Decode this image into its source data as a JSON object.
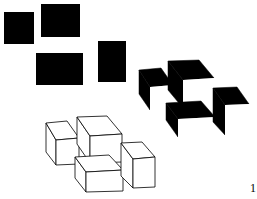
{
  "figure": {
    "background": "#ffffff",
    "ink": "#000000",
    "label": "1",
    "black_rectangles": [
      {
        "x": 4,
        "y": 12,
        "w": 30,
        "h": 32
      },
      {
        "x": 41,
        "y": 4,
        "w": 39,
        "h": 33
      },
      {
        "x": 36,
        "y": 53,
        "w": 47,
        "h": 32
      },
      {
        "x": 98,
        "y": 41,
        "w": 28,
        "h": 41
      }
    ],
    "shaded_cubes": [
      {
        "back": [
          [
            139,
            70
          ],
          [
            161,
            68
          ],
          [
            173,
            85
          ],
          [
            150,
            87
          ]
        ],
        "side": [
          [
            139,
            70
          ],
          [
            150,
            87
          ],
          [
            150,
            110
          ],
          [
            139,
            94
          ]
        ],
        "front": [
          [
            150,
            87
          ],
          [
            173,
            85
          ],
          [
            173,
            110
          ],
          [
            150,
            110
          ]
        ]
      },
      {
        "back": [
          [
            168,
            61
          ],
          [
            199,
            60
          ],
          [
            214,
            78
          ],
          [
            183,
            80
          ]
        ],
        "side": [
          [
            168,
            61
          ],
          [
            183,
            80
          ],
          [
            183,
            108
          ],
          [
            168,
            90
          ]
        ],
        "front": [
          [
            183,
            80
          ],
          [
            214,
            78
          ],
          [
            214,
            105
          ],
          [
            183,
            107
          ]
        ]
      },
      {
        "back": [
          [
            166,
            103
          ],
          [
            201,
            101
          ],
          [
            215,
            117
          ],
          [
            178,
            119
          ]
        ],
        "side": [
          [
            166,
            103
          ],
          [
            178,
            119
          ],
          [
            178,
            137
          ],
          [
            166,
            120
          ]
        ],
        "front": [
          [
            178,
            119
          ],
          [
            215,
            117
          ],
          [
            215,
            137
          ],
          [
            178,
            137
          ]
        ]
      },
      {
        "back": [
          [
            213,
            88
          ],
          [
            237,
            87
          ],
          [
            249,
            104
          ],
          [
            225,
            105
          ]
        ],
        "side": [
          [
            213,
            88
          ],
          [
            225,
            105
          ],
          [
            225,
            135
          ],
          [
            213,
            122
          ]
        ],
        "front": [
          [
            225,
            105
          ],
          [
            249,
            104
          ],
          [
            249,
            134
          ],
          [
            225,
            135
          ]
        ]
      }
    ],
    "wire_cubes": [
      {
        "top": [
          [
            46,
            123
          ],
          [
            67,
            121
          ],
          [
            79,
            138
          ],
          [
            56,
            140
          ]
        ],
        "front": [
          [
            56,
            140
          ],
          [
            79,
            138
          ],
          [
            79,
            164
          ],
          [
            56,
            165
          ]
        ],
        "side": [
          [
            46,
            123
          ],
          [
            56,
            140
          ],
          [
            56,
            165
          ],
          [
            46,
            152
          ]
        ]
      },
      {
        "top": [
          [
            77,
            117
          ],
          [
            107,
            116
          ],
          [
            122,
            134
          ],
          [
            90,
            136
          ]
        ],
        "front": [
          [
            90,
            136
          ],
          [
            122,
            134
          ],
          [
            122,
            162
          ],
          [
            90,
            163
          ]
        ],
        "side": [
          [
            77,
            117
          ],
          [
            90,
            136
          ],
          [
            90,
            163
          ],
          [
            77,
            144
          ]
        ]
      },
      {
        "top": [
          [
            75,
            157
          ],
          [
            109,
            155
          ],
          [
            123,
            170
          ],
          [
            86,
            172
          ]
        ],
        "front": [
          [
            86,
            172
          ],
          [
            123,
            170
          ],
          [
            123,
            191
          ],
          [
            86,
            192
          ]
        ],
        "side": [
          [
            75,
            157
          ],
          [
            86,
            172
          ],
          [
            86,
            192
          ],
          [
            75,
            178
          ]
        ]
      },
      {
        "top": [
          [
            121,
            143
          ],
          [
            142,
            142
          ],
          [
            155,
            157
          ],
          [
            133,
            159
          ]
        ],
        "front": [
          [
            133,
            159
          ],
          [
            155,
            157
          ],
          [
            155,
            187
          ],
          [
            133,
            188
          ]
        ],
        "side": [
          [
            121,
            143
          ],
          [
            133,
            159
          ],
          [
            133,
            188
          ],
          [
            121,
            176
          ]
        ]
      }
    ]
  }
}
